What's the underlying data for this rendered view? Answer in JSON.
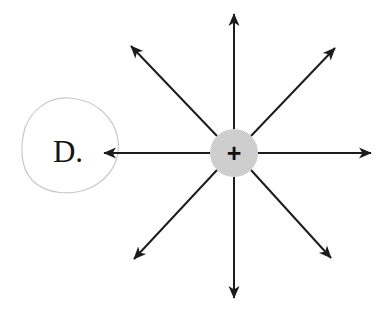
{
  "figure": {
    "background_color": "#ffffff",
    "width": 391,
    "height": 313
  },
  "charge": {
    "name": "positive-point-charge",
    "sign_label": "+",
    "center_x": 234,
    "center_y": 153,
    "radius": 24,
    "fill_color": "#d4d4d4",
    "sign_color": "#101010"
  },
  "region": {
    "name": "region-D",
    "label": "D.",
    "label_x": 68,
    "label_y": 162,
    "outline_color": "#c9c9c9",
    "outline_width": 1.2,
    "path": "M 70 98 C 96 100 115 118 118 140 C 121 160 110 178 92 187 C 72 197 45 194 32 180 C 20 167 20 146 25 128 C 31 111 48 96 70 98 Z"
  },
  "field_arrows": {
    "name": "radial-field-arrows",
    "color": "#1c1c1c",
    "line_width": 2,
    "count": 8,
    "items": [
      {
        "name": "arrow-up",
        "direction": "up",
        "angle_deg": 90,
        "x1": 234,
        "y1": 129,
        "x2": 234,
        "y2": 14
      },
      {
        "name": "arrow-upper-right",
        "direction": "upper-right",
        "angle_deg": 45,
        "x1": 251,
        "y1": 136,
        "x2": 335,
        "y2": 48
      },
      {
        "name": "arrow-right",
        "direction": "right",
        "angle_deg": 0,
        "x1": 258,
        "y1": 153,
        "x2": 371,
        "y2": 153
      },
      {
        "name": "arrow-lower-right",
        "direction": "lower-right",
        "angle_deg": -45,
        "x1": 251,
        "y1": 170,
        "x2": 331,
        "y2": 258
      },
      {
        "name": "arrow-down",
        "direction": "down",
        "angle_deg": -90,
        "x1": 234,
        "y1": 177,
        "x2": 234,
        "y2": 298
      },
      {
        "name": "arrow-lower-left",
        "direction": "lower-left",
        "angle_deg": -135,
        "x1": 217,
        "y1": 170,
        "x2": 134,
        "y2": 259
      },
      {
        "name": "arrow-left",
        "direction": "left",
        "angle_deg": 180,
        "x1": 210,
        "y1": 153,
        "x2": 104,
        "y2": 153
      },
      {
        "name": "arrow-upper-left",
        "direction": "upper-left",
        "angle_deg": 135,
        "x1": 217,
        "y1": 136,
        "x2": 131,
        "y2": 46
      }
    ]
  },
  "chart_data": {
    "type": "diagram",
    "elements": [
      {
        "kind": "circle",
        "label": "+",
        "cx": 234,
        "cy": 153,
        "r": 24,
        "fill": "#d4d4d4"
      },
      {
        "kind": "closed-curve",
        "label": "D.",
        "bbox": [
          22,
          96,
          118,
          192
        ]
      },
      {
        "kind": "arrow",
        "label": "up",
        "from": [
          234,
          129
        ],
        "to": [
          234,
          14
        ]
      },
      {
        "kind": "arrow",
        "label": "upper-right",
        "from": [
          251,
          136
        ],
        "to": [
          335,
          48
        ]
      },
      {
        "kind": "arrow",
        "label": "right",
        "from": [
          258,
          153
        ],
        "to": [
          371,
          153
        ]
      },
      {
        "kind": "arrow",
        "label": "lower-right",
        "from": [
          251,
          170
        ],
        "to": [
          331,
          258
        ]
      },
      {
        "kind": "arrow",
        "label": "down",
        "from": [
          234,
          177
        ],
        "to": [
          234,
          298
        ]
      },
      {
        "kind": "arrow",
        "label": "lower-left",
        "from": [
          217,
          170
        ],
        "to": [
          134,
          259
        ]
      },
      {
        "kind": "arrow",
        "label": "left",
        "from": [
          210,
          153
        ],
        "to": [
          104,
          153
        ]
      },
      {
        "kind": "arrow",
        "label": "upper-left",
        "from": [
          217,
          136
        ],
        "to": [
          131,
          46
        ]
      }
    ],
    "legend": [],
    "grid": false
  }
}
